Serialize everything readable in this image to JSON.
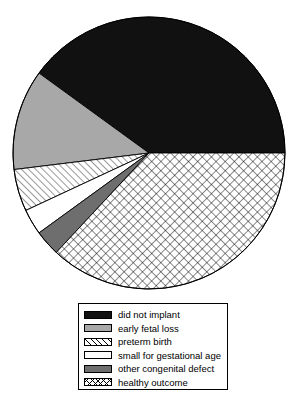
{
  "chart_data": {
    "type": "pie",
    "title": "",
    "subtitle": "",
    "xlabel": "",
    "ylabel": "",
    "legend_position": "bottom",
    "grid": false,
    "categories": [
      "did not implant",
      "early fetal loss",
      "preterm birth",
      "small for gestational age",
      "other congenital defect",
      "healthy outcome"
    ],
    "values": [
      40,
      12,
      5,
      3,
      3,
      37
    ],
    "units": "percent",
    "slices": [
      {
        "label": "did not implant",
        "value": 40,
        "fill": "solid-black",
        "color": "#111111",
        "start_angle_deg": 0,
        "end_angle_deg": 144
      },
      {
        "label": "early fetal loss",
        "value": 12,
        "fill": "light-gray",
        "color": "#a8a8a8",
        "start_angle_deg": 144,
        "end_angle_deg": 187
      },
      {
        "label": "preterm birth",
        "value": 5,
        "fill": "diagonal-hatch",
        "color": "#ffffff",
        "start_angle_deg": 187,
        "end_angle_deg": 205
      },
      {
        "label": "small for gestational age",
        "value": 3,
        "fill": "white",
        "color": "#ffffff",
        "start_angle_deg": 205,
        "end_angle_deg": 216
      },
      {
        "label": "other congenital defect",
        "value": 3,
        "fill": "dark-gray",
        "color": "#6e6e6e",
        "start_angle_deg": 216,
        "end_angle_deg": 227
      },
      {
        "label": "healthy outcome",
        "value": 37,
        "fill": "crosshatch",
        "color": "#ffffff",
        "start_angle_deg": 227,
        "end_angle_deg": 360
      }
    ]
  },
  "legend": {
    "entries": [
      {
        "label": "did not implant",
        "swatch": "solid-black"
      },
      {
        "label": "early fetal loss",
        "swatch": "light-gray"
      },
      {
        "label": "preterm birth",
        "swatch": "diagonal-hatch"
      },
      {
        "label": "small for gestational age",
        "swatch": "white"
      },
      {
        "label": "other congenital defect",
        "swatch": "dark-gray"
      },
      {
        "label": "healthy outcome",
        "swatch": "crosshatch"
      }
    ]
  }
}
